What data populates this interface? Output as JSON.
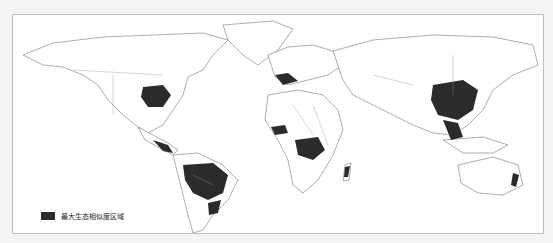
{
  "map": {
    "type": "world choropleth",
    "projection": "equirectangular-like",
    "highlight_color": "#2b2b2b",
    "land_fill": "#ffffff",
    "outline_color": "#777777",
    "highlighted_regions": [
      "Eastern United States",
      "Mexico / Central America",
      "Northern South America / Amazon basin",
      "Southeastern Brazil",
      "Western Europe / Mediterranean",
      "West Africa coast",
      "Central Africa / Congo basin",
      "Madagascar",
      "Southern & Eastern China",
      "Southeast Asia",
      "Eastern Australia coast"
    ]
  },
  "legend": {
    "items": [
      {
        "label": "最大生态相似度区域",
        "color": "#2b2b2b"
      }
    ]
  }
}
